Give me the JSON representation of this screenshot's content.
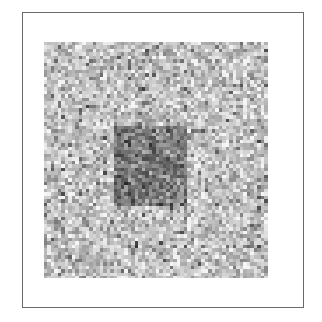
{
  "figure": {
    "frame": {
      "border_color": "#6a6a6a",
      "background": "#ffffff"
    },
    "texture": {
      "cell_size": 3.5,
      "background_mean_gray": 195,
      "background_spread": 55,
      "target_mean_gray": 120,
      "target_spread": 60,
      "seed": 1337
    },
    "target_region": {
      "label": "dark square",
      "x_frac": [
        0.3,
        0.64
      ],
      "y_frac": [
        0.35,
        0.69
      ]
    }
  }
}
